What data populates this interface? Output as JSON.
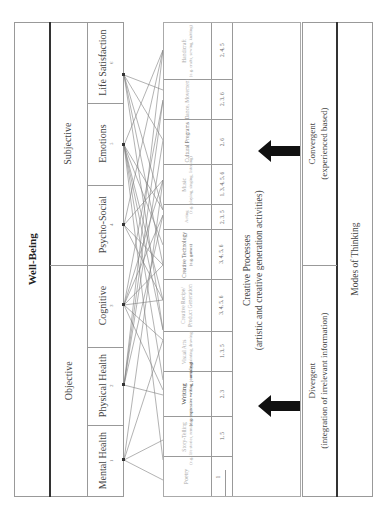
{
  "well_being": {
    "title": "Well-Being",
    "groups": [
      {
        "label": "Subjective"
      },
      {
        "label": "Objective"
      }
    ],
    "categories": [
      {
        "label": "Life Satisfaction",
        "index": "6"
      },
      {
        "label": "Emotions",
        "index": "5"
      },
      {
        "label": "Psycho-Social",
        "index": "4"
      },
      {
        "label": "Cognitive",
        "index": "3"
      },
      {
        "label": "Physical Health",
        "index": "2"
      },
      {
        "label": "Mental Health",
        "index": "1"
      }
    ]
  },
  "creative_table": {
    "index_cell": "1",
    "rows": [
      {
        "name": "Handicraft",
        "detail": "(e.g. crafts, sewing, knitting)",
        "links": "2, 4, 5"
      },
      {
        "name": "Dance, Movement",
        "detail": "",
        "links": "2, 3, 6"
      },
      {
        "name": "Cultural Programs",
        "detail": "",
        "links": "2, 6"
      },
      {
        "name": "Music",
        "detail": "(e.g. playing, singing, listening)",
        "links": "1, 3, 4, 5, 6"
      },
      {
        "name": "Acting",
        "detail": "(e.g. drama, theatre)",
        "links": "2, 3, 5"
      },
      {
        "name": "Creative Technology",
        "detail": "(e.g. games)",
        "links": "3, 4, 5, 6"
      },
      {
        "name": "Creative Recipe/ Product Generation",
        "detail": "",
        "links": "3, 4, 5, 6"
      },
      {
        "name": "Visual Arts",
        "detail": "(e.g. painting, drawing)",
        "links": "1, 3, 5"
      },
      {
        "name": "Writing",
        "detail": "(e.g. expressive writing, journaling)",
        "links": "2, 3",
        "emphasis": true
      },
      {
        "name": "Story-Telling",
        "detail": "(e.g. life stories, reminiscence)",
        "links": "1, 5"
      },
      {
        "name": "Poetry",
        "detail": "",
        "links": "1"
      }
    ]
  },
  "creative_processes": {
    "title": "Creative Processes",
    "subtitle": "(artistic and creative generation activities)"
  },
  "arrows": [
    {
      "name": "convergent-arrow",
      "direction": "left"
    },
    {
      "name": "divergent-arrow",
      "direction": "left"
    }
  ],
  "modes_of_thinking": {
    "title": "Modes of Thinking",
    "modes": [
      {
        "label": "Convergent",
        "detail": "(experienced based)"
      },
      {
        "label": "Divergent",
        "detail": "(integration of irrelevant information)"
      }
    ]
  },
  "colors": {
    "border": "#999999",
    "thick_divider": "#333333",
    "arrow": "#111111",
    "faded_text": "#aaaaaa"
  }
}
